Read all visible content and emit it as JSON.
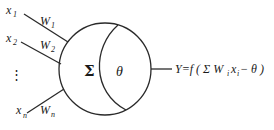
{
  "diagram": {
    "inputs": [
      {
        "x_label": "x",
        "x_sub": "1",
        "w_label": "W",
        "w_sub": "1"
      },
      {
        "x_label": "x",
        "x_sub": "2",
        "w_label": "W",
        "w_sub": "2"
      },
      {
        "x_label": "x",
        "x_sub": "n",
        "w_label": "W",
        "w_sub": "n"
      }
    ],
    "ellipsis": "⋮",
    "neuron": {
      "sum_symbol": "Σ",
      "threshold_symbol": "θ"
    },
    "output": {
      "prefix": "Y=f ( Σ W",
      "w_sub": "i",
      "x": "x",
      "x_sub": "i",
      "suffix": " − θ )"
    },
    "colors": {
      "line": "#2a2a2a",
      "text": "#1a1a1a",
      "background": "#ffffff"
    }
  }
}
